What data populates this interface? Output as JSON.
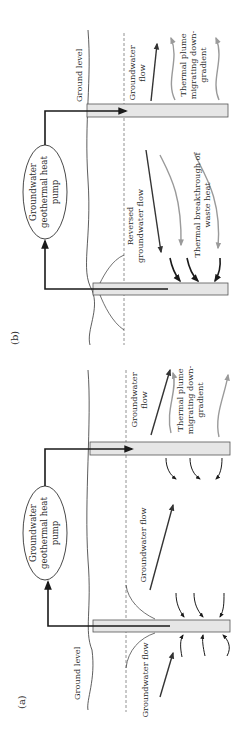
{
  "figure": {
    "orientation": "rotated-90-ccw",
    "colors": {
      "line": "#1a1a1a",
      "well_fill": "#e6e6e6",
      "well_stroke": "#555555",
      "thermal_arrow": "#9a9a9a",
      "flow_arrow": "#333333",
      "dashed_water_table": "#777777"
    }
  },
  "panel_b": {
    "label": "(b)",
    "pump": {
      "line1": "Groundwater",
      "line2": "geothermal heat",
      "line3": "pump"
    },
    "ground_level": "Ground level",
    "groundwater_flow": {
      "line1": "Groundwater",
      "line2": "flow"
    },
    "thermal_plume": {
      "line1": "Thermal plume",
      "line2": "migrating down-",
      "line3": "gradient"
    },
    "reversed_flow": {
      "line1": "Reversed",
      "line2": "groundwater flow"
    },
    "thermal_breakthrough": {
      "line1": "Thermal breakthrough of",
      "line2": "waste heat"
    }
  },
  "panel_a": {
    "label": "(a)",
    "pump": {
      "line1": "Groundwater",
      "line2": "geothermal heat",
      "line3": "pump"
    },
    "ground_level": "Ground level",
    "groundwater_flow_left": "Groundwater flow",
    "groundwater_flow_middle": "Groundwater flow",
    "groundwater_flow_right": {
      "line1": "Groundwater",
      "line2": "flow"
    },
    "thermal_plume": {
      "line1": "Thermal plume",
      "line2": "migrating down-",
      "line3": "gradient"
    }
  }
}
